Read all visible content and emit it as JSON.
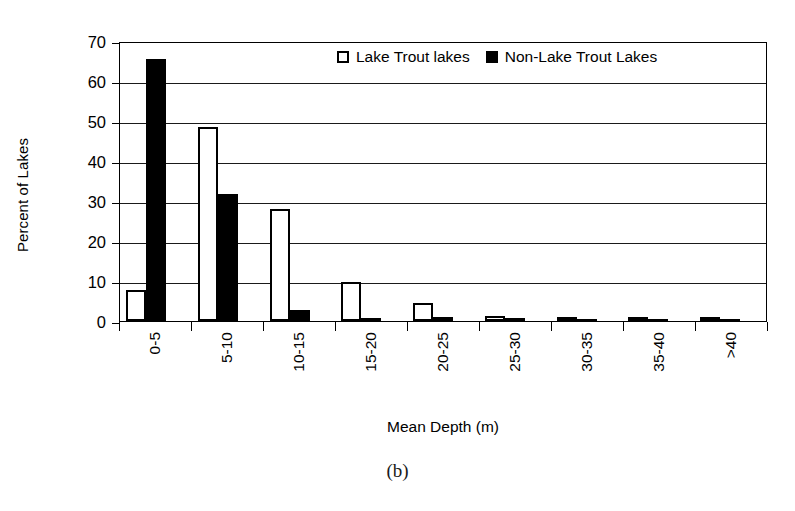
{
  "caption": "(b)",
  "legend": {
    "position": "top-right-inside",
    "items": [
      {
        "label": "Lake Trout lakes",
        "swatch": "hollow-square",
        "color": "#ffffff"
      },
      {
        "label": "Non-Lake Trout Lakes",
        "swatch": "filled-square",
        "color": "#000000"
      }
    ]
  },
  "axes": {
    "y_title": "Percent of Lakes",
    "x_title": "Mean Depth (m)",
    "y_ticks": [
      "70",
      "60",
      "50",
      "40",
      "30",
      "20",
      "10",
      "0"
    ]
  },
  "chart_data": {
    "type": "bar",
    "title": "",
    "subtitle": "",
    "xlabel": "Mean Depth (m)",
    "ylabel": "Percent of Lakes",
    "ylim": [
      0,
      70
    ],
    "ytick_interval": 10,
    "grid": true,
    "legend_position": "top right, inside plot area",
    "categories": [
      "0-5",
      "5-10",
      "10-15",
      "15-20",
      "20-25",
      "25-30",
      "30-35",
      "35-40",
      ">40"
    ],
    "series": [
      {
        "name": "Lake Trout lakes",
        "color": "#ffffff",
        "edge_color": "#000000",
        "values": [
          7.8,
          48.5,
          28.0,
          9.8,
          4.6,
          1.3,
          0.5,
          0.5,
          0.5
        ]
      },
      {
        "name": "Non-Lake Trout Lakes",
        "color": "#000000",
        "edge_color": "#000000",
        "values": [
          65.5,
          31.7,
          2.8,
          0.8,
          1.0,
          0.7,
          0.4,
          0.4,
          0.4
        ]
      }
    ],
    "annotations": [
      "(b)"
    ]
  }
}
